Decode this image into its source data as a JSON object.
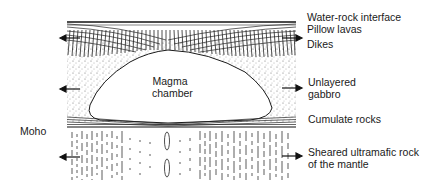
{
  "diagram": {
    "title": "",
    "center_label": [
      "Magma",
      "chamber"
    ],
    "left_label": "Moho",
    "right_labels": [
      {
        "id": "water-rock",
        "lines": [
          "Water-rock interface"
        ],
        "arrow": false
      },
      {
        "id": "pillow-lavas",
        "lines": [
          "Pillow lavas"
        ],
        "arrow": false
      },
      {
        "id": "dikes",
        "lines": [
          "Dikes"
        ],
        "arrow": true
      },
      {
        "id": "gabbro",
        "lines": [
          "Unlayered",
          "gabbro"
        ],
        "arrow": true
      },
      {
        "id": "cumulate",
        "lines": [
          "Cumulate rocks"
        ],
        "arrow": false
      },
      {
        "id": "mantle",
        "lines": [
          "Sheared ultramafic rock",
          "of the mantle"
        ],
        "arrow": true
      }
    ],
    "left_arrows": [
      "dikes",
      "gabbro",
      "mantle"
    ],
    "colors": {
      "ink": "#1a1a1a",
      "stipple": "#555555",
      "background": "#ffffff"
    }
  }
}
